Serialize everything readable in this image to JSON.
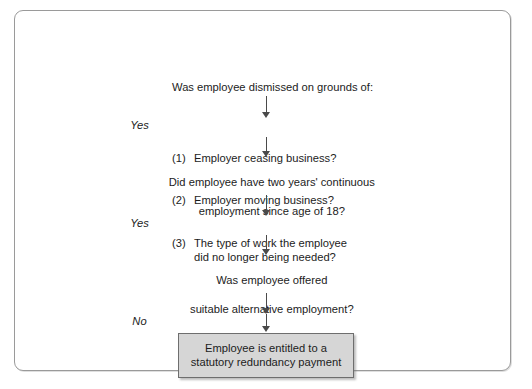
{
  "diagram": {
    "frame": {
      "border_color": "#9a9a9a",
      "background": "#ffffff"
    },
    "nodes": [
      {
        "id": "dismissal-grounds",
        "heading": "Was employee dismissed on grounds of:",
        "items": [
          {
            "marker": "(1)",
            "text": "Employer ceasing business?"
          },
          {
            "marker": "(2)",
            "text": "Employer moving business?"
          },
          {
            "marker": "(3)",
            "text": "The type of work the employee\ndid no longer being needed?"
          }
        ]
      },
      {
        "id": "continuous-employment",
        "line1": "Did employee have two years' continuous",
        "line2": "employment since age of 18?"
      },
      {
        "id": "alternative-employment",
        "line1": "Was employee offered",
        "line2": "suitable alternative employment?"
      }
    ],
    "branch_labels": [
      {
        "id": "branch-yes-1",
        "label": "Yes"
      },
      {
        "id": "branch-yes-2",
        "label": "Yes"
      },
      {
        "id": "branch-no",
        "label": "No"
      }
    ],
    "outcome": {
      "id": "entitlement-outcome",
      "line1": "Employee is entitled to a",
      "line2": "statutory redundancy payment",
      "fill_color": "#d6d6d6",
      "border_color": "#6e6e6e"
    },
    "connector_color": "#4a4a4a"
  }
}
